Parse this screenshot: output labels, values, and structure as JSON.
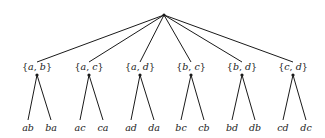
{
  "diagram": {
    "type": "tree",
    "root": {
      "x": 164,
      "y": 15
    },
    "sets": [
      {
        "label": "{a, b}",
        "a": "a",
        "b": "b",
        "x": 37,
        "leaves": [
          {
            "label": "ab",
            "x": 28
          },
          {
            "label": "ba",
            "x": 51
          }
        ]
      },
      {
        "label": "{a, c}",
        "a": "a",
        "b": "c",
        "x": 89,
        "leaves": [
          {
            "label": "ac",
            "x": 80
          },
          {
            "label": "ca",
            "x": 103
          }
        ]
      },
      {
        "label": "{a, d}",
        "a": "a",
        "b": "d",
        "x": 140,
        "leaves": [
          {
            "label": "ad",
            "x": 131
          },
          {
            "label": "da",
            "x": 154
          }
        ]
      },
      {
        "label": "{b, c}",
        "a": "b",
        "b": "c",
        "x": 191,
        "leaves": [
          {
            "label": "bc",
            "x": 181
          },
          {
            "label": "cb",
            "x": 204
          }
        ]
      },
      {
        "label": "{b, d}",
        "a": "b",
        "b": "d",
        "x": 242,
        "leaves": [
          {
            "label": "bd",
            "x": 232
          },
          {
            "label": "db",
            "x": 255
          }
        ]
      },
      {
        "label": "{c, d}",
        "a": "c",
        "b": "d",
        "x": 293,
        "leaves": [
          {
            "label": "cd",
            "x": 283
          },
          {
            "label": "dc",
            "x": 306
          }
        ]
      }
    ]
  }
}
